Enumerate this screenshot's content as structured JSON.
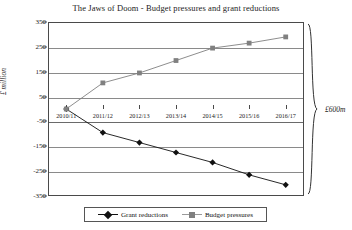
{
  "chart_data": {
    "type": "line",
    "title": "The Jaws of Doom - Budget pressures and grant reductions",
    "xlabel": "",
    "ylabel": "£ million",
    "ylim": [
      -350,
      350
    ],
    "yticks": [
      350,
      250,
      150,
      50,
      -50,
      -150,
      -250,
      -350
    ],
    "grid": true,
    "legend_position": "bottom",
    "categories": [
      "2010/11",
      "2011/12",
      "2012/13",
      "2013/14",
      "2014/15",
      "2015/16",
      "2016/17"
    ],
    "series": [
      {
        "name": "Grant reductions",
        "marker": "diamond",
        "color": "#111111",
        "values": [
          0,
          -95,
          -135,
          -175,
          -215,
          -265,
          -305
        ]
      },
      {
        "name": "Budget pressures",
        "marker": "square",
        "color": "#808080",
        "values": [
          0,
          105,
          145,
          195,
          245,
          265,
          290
        ]
      }
    ],
    "annotations": [
      {
        "name": "total-gap-brace",
        "label": "£600m"
      }
    ]
  },
  "axis": {
    "y_label": "£ million",
    "y_ticks": [
      "350",
      "250",
      "150",
      "50",
      "-50",
      "-150",
      "-250",
      "-350"
    ],
    "x_ticks": [
      "2010/11",
      "2011/12",
      "2012/13",
      "2013/14",
      "2014/15",
      "2015/16",
      "2016/17"
    ]
  },
  "legend": {
    "items": [
      {
        "label": "Grant reductions",
        "color": "#111111",
        "marker": "diamond"
      },
      {
        "label": "Budget pressures",
        "color": "#808080",
        "marker": "square"
      }
    ]
  },
  "annotation": {
    "brace_label": "£600m"
  },
  "colors": {
    "grant_reductions": "#111111",
    "budget_pressures": "#808080",
    "frame": "#4a4a4a",
    "grid": "#8a8a8a"
  }
}
